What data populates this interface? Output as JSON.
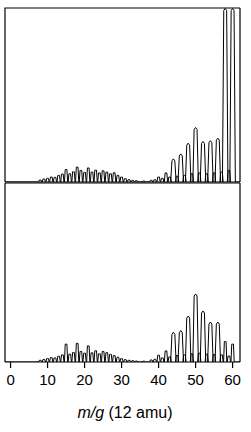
{
  "figure": {
    "name": "carbon-cluster-mass-spectrum",
    "axis_title_italic": "m/g",
    "axis_title_rest": " (12 amu)",
    "axis_title_full": "m/g (12 amu)",
    "colors": {
      "ink": "#000000",
      "background": "#ffffff",
      "frame": "#555555"
    }
  },
  "chart_data": {
    "type": "line",
    "title": "",
    "subtitle": "",
    "xlabel": "m/g (12 amu)",
    "ylabel": "",
    "xlim": [
      -1.5,
      62
    ],
    "ylim": [
      0,
      1.0
    ],
    "grid": false,
    "legend": "none",
    "xticks": [
      0,
      10,
      20,
      30,
      40,
      50,
      60
    ],
    "xticklabels": [
      "0",
      "10",
      "20",
      "30",
      "40",
      "50",
      "60"
    ],
    "annotations": [
      "Top panel peaks at m/g 58 and 60 are clipped by the panel frame",
      "Low-mass region 8-32 shows unit-spaced cluster peaks",
      "High-mass region 38-60 shows even-numbered cluster peaks"
    ],
    "series": [
      {
        "name": "top-panel-spectrum",
        "panel": "top",
        "clipped_peaks": [
          58,
          60
        ],
        "x": [
          8,
          9,
          10,
          11,
          12,
          13,
          14,
          15,
          16,
          17,
          18,
          19,
          20,
          21,
          22,
          23,
          24,
          25,
          26,
          27,
          28,
          29,
          30,
          31,
          32,
          33,
          34,
          36,
          38,
          39,
          40,
          41,
          42,
          43,
          44,
          45,
          46,
          47,
          48,
          49,
          50,
          51,
          52,
          53,
          54,
          55,
          56,
          57,
          58,
          59,
          60
        ],
        "values": [
          0.012,
          0.018,
          0.022,
          0.03,
          0.028,
          0.04,
          0.048,
          0.075,
          0.05,
          0.062,
          0.09,
          0.07,
          0.058,
          0.085,
          0.06,
          0.072,
          0.055,
          0.068,
          0.06,
          0.05,
          0.056,
          0.04,
          0.03,
          0.02,
          0.014,
          0.01,
          0.008,
          0.006,
          0.01,
          0.014,
          0.03,
          0.022,
          0.055,
          0.03,
          0.14,
          0.035,
          0.17,
          0.04,
          0.235,
          0.05,
          0.33,
          0.055,
          0.245,
          0.05,
          0.25,
          0.055,
          0.265,
          0.06,
          1.05,
          0.07,
          1.05
        ]
      },
      {
        "name": "bottom-panel-spectrum",
        "panel": "bottom",
        "clipped_peaks": [],
        "x": [
          8,
          9,
          10,
          11,
          12,
          13,
          14,
          15,
          16,
          17,
          18,
          19,
          20,
          21,
          22,
          23,
          24,
          25,
          26,
          27,
          28,
          29,
          30,
          31,
          32,
          33,
          34,
          36,
          38,
          39,
          40,
          41,
          42,
          43,
          44,
          45,
          46,
          47,
          48,
          49,
          50,
          51,
          52,
          53,
          54,
          55,
          56,
          57,
          58,
          59,
          60
        ],
        "values": [
          0.01,
          0.015,
          0.02,
          0.026,
          0.024,
          0.034,
          0.042,
          0.105,
          0.046,
          0.056,
          0.11,
          0.062,
          0.052,
          0.095,
          0.054,
          0.066,
          0.048,
          0.062,
          0.055,
          0.045,
          0.038,
          0.028,
          0.02,
          0.014,
          0.01,
          0.008,
          0.006,
          0.005,
          0.012,
          0.016,
          0.04,
          0.024,
          0.065,
          0.03,
          0.175,
          0.038,
          0.185,
          0.042,
          0.27,
          0.048,
          0.4,
          0.052,
          0.3,
          0.046,
          0.235,
          0.044,
          0.235,
          0.042,
          0.12,
          0.035,
          0.105
        ]
      }
    ]
  }
}
